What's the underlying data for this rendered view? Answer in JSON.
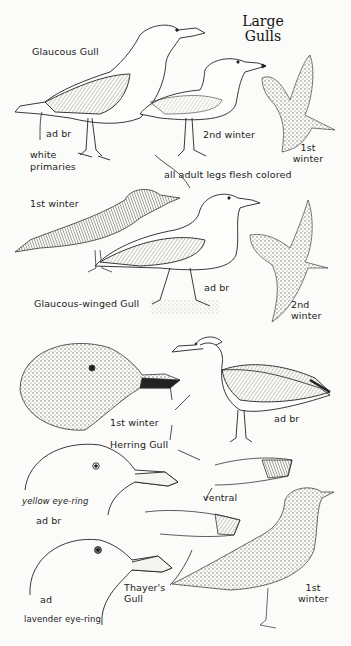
{
  "page": {
    "title": [
      "Large",
      "Gulls"
    ]
  },
  "species": [
    {
      "name": "Glaucous Gull",
      "labels": {
        "adult": "ad br",
        "note": [
          "white",
          "primaries"
        ],
        "second_winter": "2nd winter",
        "first_winter": [
          "1st",
          "winter"
        ]
      }
    },
    {
      "name": "Glaucous-winged Gull",
      "labels": {
        "first_winter": "1st winter",
        "adult": "ad br",
        "second_winter": [
          "2nd",
          "winter"
        ]
      }
    },
    {
      "name": "Herring Gull",
      "labels": {
        "first_winter": "1st winter",
        "adult": "ad br",
        "ventral": "ventral",
        "eye_ring": "yellow eye-ring",
        "head_adult": "ad br"
      }
    },
    {
      "name": [
        "Thayer's",
        "Gull"
      ],
      "labels": {
        "head_adult": "ad",
        "eye_ring": "lavender eye-ring",
        "first_winter": [
          "1st",
          "winter"
        ]
      }
    }
  ],
  "notes": {
    "legs": "all adult legs flesh colored"
  },
  "colors": {
    "ink": "#222222",
    "paper": "#fbfbf9",
    "wing_shade": "#9a9a96",
    "juvenile_shade": "#6e6a64"
  }
}
